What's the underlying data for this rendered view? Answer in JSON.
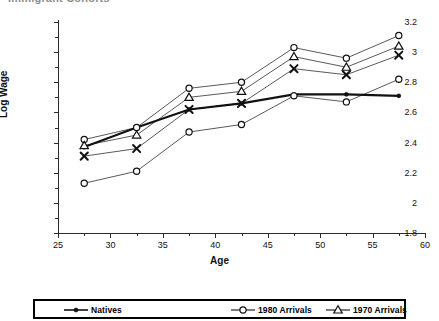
{
  "cropped_heading": "Immigrant Cohorts",
  "chart_data": {
    "type": "line",
    "title": "",
    "xlabel": "Age",
    "ylabel": "Log Wage",
    "x": [
      27.5,
      32.5,
      37.5,
      42.5,
      47.5,
      52.5,
      57.5
    ],
    "xlim": [
      25,
      60
    ],
    "ylim": [
      1.8,
      3.2
    ],
    "xticks": [
      25,
      30,
      35,
      40,
      45,
      50,
      55,
      60
    ],
    "xticklabels": [
      "25",
      "30",
      "35",
      "40",
      "45",
      "50",
      "55",
      "60"
    ],
    "xminorticks": [
      27.5,
      32.5,
      37.5,
      42.5,
      47.5,
      52.5,
      57.5
    ],
    "yticks": [
      1.8,
      2.0,
      2.2,
      2.4,
      2.6,
      2.8,
      3.0,
      3.2
    ],
    "yticklabels": [
      "1.8",
      "2",
      "2.2",
      "2.4",
      "2.6",
      "2.8",
      "3",
      "3.2"
    ],
    "yminorticks": [
      1.9,
      2.1,
      2.3,
      2.5,
      2.7,
      2.9,
      3.1
    ],
    "grid": false,
    "legend_position": "bottom",
    "series": [
      {
        "name": "Natives",
        "marker": "filled-circle",
        "line_weight": "thick",
        "in_legend": true,
        "values": [
          2.37,
          2.5,
          2.62,
          2.66,
          2.72,
          2.72,
          2.71
        ]
      },
      {
        "name": "1980 Arrivals",
        "marker": "open-circle",
        "line_weight": "thin",
        "in_legend": true,
        "values": [
          2.42,
          2.5,
          2.76,
          2.8,
          3.03,
          2.96,
          3.11
        ]
      },
      {
        "name": "1970 Arrivals",
        "marker": "open-triangle",
        "line_weight": "thin",
        "in_legend": true,
        "values": [
          2.38,
          2.45,
          2.7,
          2.74,
          2.97,
          2.9,
          3.04
        ]
      },
      {
        "name": "",
        "marker": "cross-x",
        "line_weight": "thin",
        "in_legend": false,
        "values": [
          2.31,
          2.36,
          2.62,
          2.66,
          2.89,
          2.85,
          2.98
        ]
      },
      {
        "name": "",
        "marker": "open-circle",
        "line_weight": "thin",
        "in_legend": false,
        "values": [
          2.13,
          2.21,
          2.47,
          2.52,
          2.71,
          2.67,
          2.82
        ]
      }
    ]
  },
  "legend": {
    "items": [
      {
        "label": "Natives",
        "marker": "filled-circle"
      },
      {
        "label": "1980 Arrivals",
        "marker": "open-circle"
      },
      {
        "label": "1970 Arrivals",
        "marker": "open-triangle"
      }
    ]
  }
}
